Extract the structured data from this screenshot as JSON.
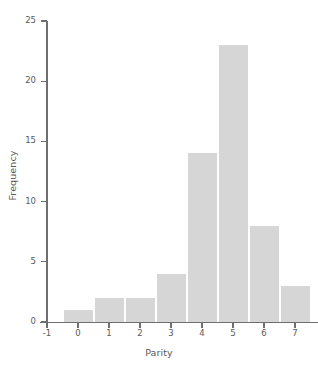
{
  "chart": {
    "clipped_title": "Histogram of Parity",
    "bar_color": "#d6d6d6",
    "axis_color": "#6e6e6e",
    "text_color": "#595959"
  },
  "chart_data": {
    "type": "bar",
    "title": "",
    "xlabel": "Parity",
    "ylabel": "Frequency",
    "categories": [
      "0",
      "1",
      "2",
      "3",
      "4",
      "5",
      "6",
      "7"
    ],
    "values": [
      1,
      2,
      2,
      4,
      14,
      23,
      8,
      3
    ],
    "x": [
      0,
      1,
      2,
      3,
      4,
      5,
      6,
      7
    ],
    "xlim": [
      -1,
      7.5
    ],
    "ylim": [
      0,
      25
    ],
    "xticks": [
      "-1",
      "0",
      "1",
      "2",
      "3",
      "4",
      "5",
      "6",
      "7"
    ],
    "yticks": [
      "0",
      "5",
      "10",
      "15",
      "20",
      "25"
    ],
    "ytick_values": [
      0,
      5,
      10,
      15,
      20,
      25
    ],
    "xtick_values": [
      -1,
      0,
      1,
      2,
      3,
      4,
      5,
      6,
      7
    ],
    "grid": false,
    "legend": null,
    "bar_width": 1
  }
}
